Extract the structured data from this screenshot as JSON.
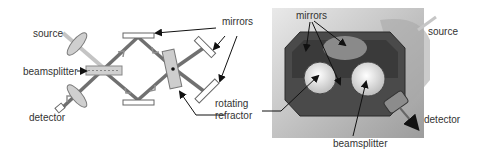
{
  "left_diagram": {
    "labels": {
      "source": "source",
      "beamsplitter": "beamsplitter",
      "detector": "detector",
      "mirrors": "mirrors",
      "rotating": "rotating",
      "refractor": "refractor"
    }
  },
  "right_photo": {
    "labels": {
      "mirrors": "mirrors",
      "source": "source",
      "detector": "detector",
      "beamsplitter": "beamsplitter"
    }
  },
  "colors": {
    "beam_dark": "#6e6e6e",
    "beam_light": "#bdbdbd",
    "optic_fill": "#d6d6d6",
    "label": "#333333",
    "arrow": "#111111"
  }
}
